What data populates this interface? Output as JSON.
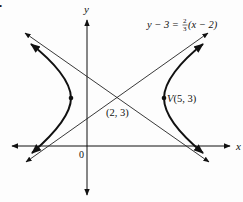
{
  "diagram": {
    "type": "hyperbola-graph",
    "axes": {
      "x_label": "x",
      "y_label": "y",
      "origin_label": "0"
    },
    "equation_label": {
      "lhs": "y − 3 = ",
      "frac_num": "2",
      "frac_den": "3",
      "rhs": "(x − 2)"
    },
    "center_label": "(2, 3)",
    "vertex_label": "V(5, 3)",
    "hyperbola": {
      "center": [
        2,
        3
      ],
      "a": 3,
      "b": 2,
      "orientation": "horizontal"
    },
    "asymptotes": [
      "y − 3 = (2/3)(x − 2)",
      "y − 3 = −(2/3)(x − 2)"
    ],
    "marked_points": [
      [
        5,
        3
      ],
      [
        -1,
        3
      ]
    ],
    "bullet": "•"
  }
}
